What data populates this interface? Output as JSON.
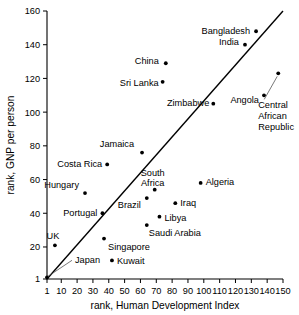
{
  "chart_data": {
    "type": "scatter",
    "title": "",
    "xlabel": "rank, Human Development Index",
    "ylabel": "rank, GNP per person",
    "xlim": [
      1,
      150
    ],
    "ylim": [
      1,
      160
    ],
    "xticks": [
      1,
      10,
      20,
      30,
      40,
      50,
      60,
      70,
      80,
      90,
      100,
      110,
      120,
      130,
      140,
      150
    ],
    "yticks": [
      1,
      20,
      40,
      60,
      80,
      100,
      120,
      140,
      160
    ],
    "xticklabels": [
      "1",
      "10",
      "20",
      "30",
      "40",
      "50",
      "60",
      "70",
      "80",
      "90",
      "100",
      "110",
      "120",
      "130",
      "140",
      "150"
    ],
    "yticklabels": [
      "1",
      "20",
      "40",
      "60",
      "80",
      "100",
      "120",
      "140",
      "160"
    ],
    "grid": false,
    "legend": "none",
    "reference_line": {
      "name": "equality-line",
      "from": [
        1,
        1
      ],
      "to": [
        150,
        160
      ],
      "description": "y = x diagonal"
    },
    "points": [
      {
        "name": "Japan",
        "x": 1,
        "y": 2,
        "label": "Japan",
        "label_pos": "leader-right",
        "label_dx": 28,
        "label_dy": -14
      },
      {
        "name": "UK",
        "x": 6,
        "y": 21,
        "label": "UK",
        "label_pos": "above",
        "label_dx": -2,
        "label_dy": -6
      },
      {
        "name": "Hungary",
        "x": 25,
        "y": 52,
        "label": "Hungary",
        "label_pos": "left",
        "label_dx": -6,
        "label_dy": -5
      },
      {
        "name": "Portugal",
        "x": 36,
        "y": 40,
        "label": "Portugal",
        "label_pos": "left",
        "label_dx": -5,
        "label_dy": 3
      },
      {
        "name": "Singapore",
        "x": 37,
        "y": 25,
        "label": "Singapore",
        "label_pos": "below-right",
        "label_dx": 4,
        "label_dy": 11
      },
      {
        "name": "Costa Rica",
        "x": 39,
        "y": 69,
        "label": "Costa Rica",
        "label_pos": "left",
        "label_dx": -5,
        "label_dy": 3
      },
      {
        "name": "Kuwait",
        "x": 42,
        "y": 12,
        "label": "Kuwait",
        "label_pos": "right",
        "label_dx": 5,
        "label_dy": 4
      },
      {
        "name": "Jamaica",
        "x": 61,
        "y": 76,
        "label": "Jamaica",
        "label_pos": "above-left",
        "label_dx": -8,
        "label_dy": -6
      },
      {
        "name": "Brazil",
        "x": 64,
        "y": 49,
        "label": "Brazil",
        "label_pos": "below-left",
        "label_dx": -6,
        "label_dy": 10
      },
      {
        "name": "Saudi Arabia",
        "x": 64,
        "y": 33,
        "label": "Saudi Arabia",
        "label_pos": "below-right",
        "label_dx": 2,
        "label_dy": 11
      },
      {
        "name": "South Africa",
        "x": 69,
        "y": 54,
        "label": "South Africa",
        "label_pos": "above",
        "label_dx": -2,
        "label_dy": -14
      },
      {
        "name": "Libya",
        "x": 72,
        "y": 38,
        "label": "Libya",
        "label_pos": "right",
        "label_dx": 5,
        "label_dy": 4
      },
      {
        "name": "Sri Lanka",
        "x": 74,
        "y": 118,
        "label": "Sri Lanka",
        "label_pos": "left",
        "label_dx": -4,
        "label_dy": 4
      },
      {
        "name": "China",
        "x": 76,
        "y": 129,
        "label": "China",
        "label_pos": "left",
        "label_dx": -7,
        "label_dy": 1
      },
      {
        "name": "Iraq",
        "x": 82,
        "y": 46,
        "label": "Iraq",
        "label_pos": "right",
        "label_dx": 5,
        "label_dy": 3
      },
      {
        "name": "Algeria",
        "x": 98,
        "y": 58,
        "label": "Algeria",
        "label_pos": "right",
        "label_dx": 5,
        "label_dy": 2
      },
      {
        "name": "Zimbabwe",
        "x": 106,
        "y": 105,
        "label": "Zimbabwe",
        "label_pos": "left",
        "label_dx": -4,
        "label_dy": 2
      },
      {
        "name": "India",
        "x": 126,
        "y": 140,
        "label": "India",
        "label_pos": "left",
        "label_dx": -6,
        "label_dy": 0
      },
      {
        "name": "Bangladesh",
        "x": 133,
        "y": 148,
        "label": "Bangladesh",
        "label_pos": "left",
        "label_dx": -6,
        "label_dy": 3
      },
      {
        "name": "Angola",
        "x": 138,
        "y": 110,
        "label": "Angola",
        "label_pos": "left",
        "label_dx": -5,
        "label_dy": 8
      },
      {
        "name": "Central African Republic",
        "x": 147,
        "y": 123,
        "label": "Central African Republic",
        "label_pos": "leader-below",
        "label_dx": -20,
        "label_dy": 35
      }
    ],
    "annotations": [
      {
        "name": "central-african-republic-block",
        "lines": [
          "Central",
          "African",
          "Republic"
        ]
      }
    ]
  },
  "axes": {
    "x_title": "rank, Human Development Index",
    "y_title": "rank, GNP per person"
  }
}
